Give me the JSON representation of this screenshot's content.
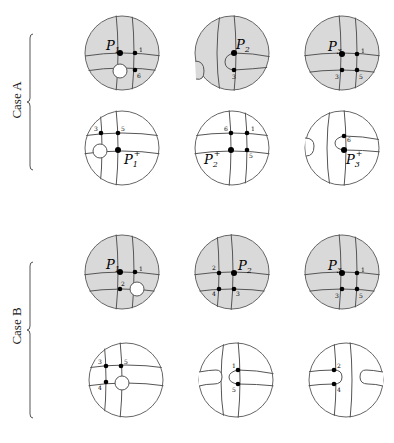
{
  "cases": [
    {
      "label": "Case A"
    },
    {
      "label": "Case B"
    }
  ],
  "panels": {
    "A_top": [
      {
        "point": "P",
        "sub": "1",
        "sup": "",
        "dots": [
          "1",
          "6"
        ]
      },
      {
        "point": "P",
        "sub": "2",
        "sup": "",
        "dots": [
          "3"
        ]
      },
      {
        "point": "P",
        "sub": "3",
        "sup": "",
        "dots": [
          "1",
          "3",
          "5"
        ]
      }
    ],
    "A_bottom": [
      {
        "point": "P",
        "sub": "1",
        "sup": "+",
        "dots": [
          "3",
          "5"
        ]
      },
      {
        "point": "P",
        "sub": "2",
        "sup": "+",
        "dots": [
          "6",
          "1",
          "5"
        ]
      },
      {
        "point": "P",
        "sub": "3",
        "sup": "+",
        "dots": [
          "6"
        ]
      }
    ],
    "B_top": [
      {
        "point": "P",
        "sub": "1",
        "sup": "",
        "dots": [
          "1",
          "2"
        ]
      },
      {
        "point": "P",
        "sub": "2",
        "sup": "",
        "dots": [
          "2",
          "4",
          "3"
        ]
      },
      {
        "point": "P",
        "sub": "3",
        "sup": "",
        "dots": [
          "1",
          "3",
          "5"
        ]
      }
    ],
    "B_bottom": [
      {
        "dots": [
          "3",
          "5",
          "4"
        ]
      },
      {
        "dots": [
          "1",
          "5"
        ]
      },
      {
        "dots": [
          "2",
          "4"
        ]
      }
    ]
  },
  "colors": {
    "sphere_fill": "#d9d9d9",
    "stroke": "#555555",
    "dot": "#000000"
  }
}
